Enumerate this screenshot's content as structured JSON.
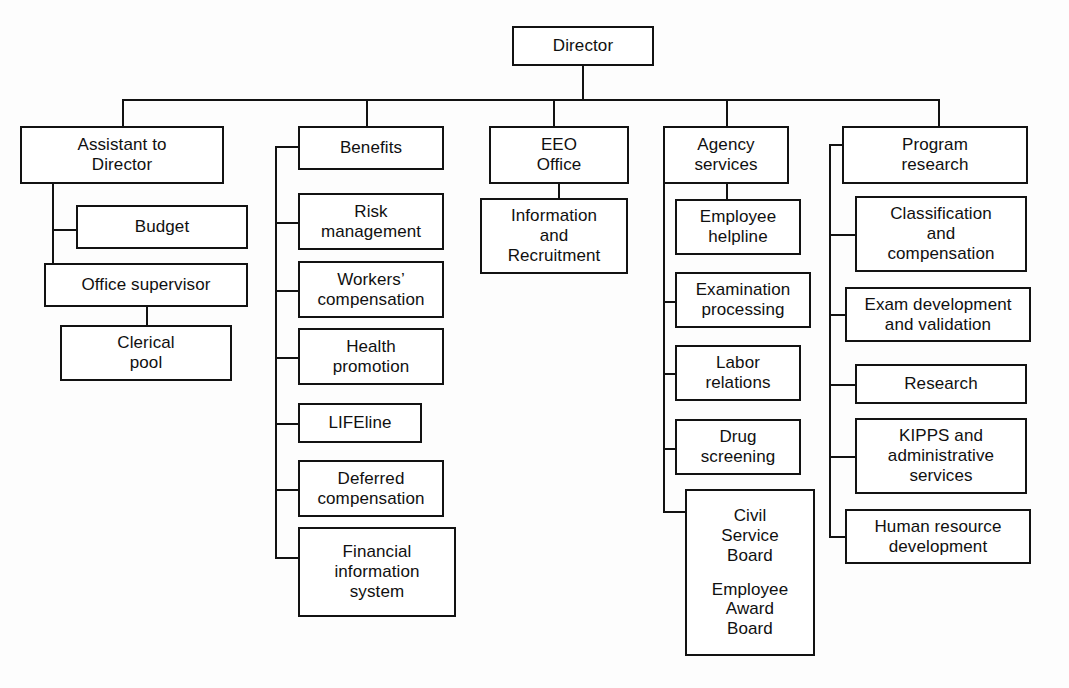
{
  "chart": {
    "type": "org-chart",
    "background_color": "#fdfdfd",
    "line_color": "#121212",
    "box_fill": "#ffffff"
  },
  "root": {
    "label": "Director"
  },
  "divisions": [
    {
      "id": "assistant-to-director",
      "header": "Assistant to\nDirector",
      "header_lines": [
        "Assistant to",
        "Director"
      ],
      "children": [
        {
          "id": "budget",
          "lines": [
            "Budget"
          ]
        },
        {
          "id": "office-supervisor",
          "lines": [
            "Office supervisor"
          ]
        }
      ],
      "grandchildren": [
        {
          "id": "clerical-pool",
          "parent": "office-supervisor",
          "lines": [
            "Clerical",
            "pool"
          ]
        }
      ]
    },
    {
      "id": "benefits",
      "header": "Benefits",
      "header_lines": [
        "Benefits"
      ],
      "children": [
        {
          "id": "risk-management",
          "lines": [
            "Risk",
            "management"
          ]
        },
        {
          "id": "workers-compensation",
          "lines": [
            "Workers’",
            "compensation"
          ]
        },
        {
          "id": "health-promotion",
          "lines": [
            "Health",
            "promotion"
          ]
        },
        {
          "id": "lifeline",
          "lines": [
            "LIFEline"
          ]
        },
        {
          "id": "deferred-compensation",
          "lines": [
            "Deferred",
            "compensation"
          ]
        },
        {
          "id": "financial-information-system",
          "lines": [
            "Financial",
            "information",
            "system"
          ]
        }
      ]
    },
    {
      "id": "eeo-office",
      "header": "EEO\nOffice",
      "header_lines": [
        "EEO",
        "Office"
      ],
      "children": [
        {
          "id": "information-and-recruitment",
          "lines": [
            "Information",
            "and",
            "Recruitment"
          ]
        }
      ]
    },
    {
      "id": "agency-services",
      "header": "Agency\nservices",
      "header_lines": [
        "Agency",
        "services"
      ],
      "children": [
        {
          "id": "employee-helpline",
          "lines": [
            "Employee",
            "helpline"
          ]
        },
        {
          "id": "examination-processing",
          "lines": [
            "Examination",
            "processing"
          ]
        },
        {
          "id": "labor-relations",
          "lines": [
            "Labor",
            "relations"
          ]
        },
        {
          "id": "drug-screening",
          "lines": [
            "Drug",
            "screening"
          ]
        },
        {
          "id": "boards",
          "lines": [
            "Civil",
            "Service",
            "Board",
            "",
            "Employee",
            "Award",
            "Board"
          ]
        }
      ]
    },
    {
      "id": "program-research",
      "header": "Program\nresearch",
      "header_lines": [
        "Program",
        "research"
      ],
      "children": [
        {
          "id": "classification-and-compensation",
          "lines": [
            "Classification",
            "and",
            "compensation"
          ]
        },
        {
          "id": "exam-development-and-validation",
          "lines": [
            "Exam development",
            "and validation"
          ]
        },
        {
          "id": "research",
          "lines": [
            "Research"
          ]
        },
        {
          "id": "kipps-and-administrative-services",
          "lines": [
            "KIPPS and",
            "administrative",
            "services"
          ]
        },
        {
          "id": "human-resource-development",
          "lines": [
            "Human resource",
            "development"
          ]
        }
      ]
    }
  ],
  "labels": {
    "director": "Director",
    "assistant_to_director_l1": "Assistant to",
    "assistant_to_director_l2": "Director",
    "budget": "Budget",
    "office_supervisor": "Office supervisor",
    "clerical_pool_l1": "Clerical",
    "clerical_pool_l2": "pool",
    "benefits": "Benefits",
    "risk_management_l1": "Risk",
    "risk_management_l2": "management",
    "workers_compensation_l1": "Workers’",
    "workers_compensation_l2": "compensation",
    "health_promotion_l1": "Health",
    "health_promotion_l2": "promotion",
    "lifeline": "LIFEline",
    "deferred_compensation_l1": "Deferred",
    "deferred_compensation_l2": "compensation",
    "financial_information_system_l1": "Financial",
    "financial_information_system_l2": "information",
    "financial_information_system_l3": "system",
    "eeo_office_l1": "EEO",
    "eeo_office_l2": "Office",
    "information_and_recruitment_l1": "Information",
    "information_and_recruitment_l2": "and",
    "information_and_recruitment_l3": "Recruitment",
    "agency_services_l1": "Agency",
    "agency_services_l2": "services",
    "employee_helpline_l1": "Employee",
    "employee_helpline_l2": "helpline",
    "examination_processing_l1": "Examination",
    "examination_processing_l2": "processing",
    "labor_relations_l1": "Labor",
    "labor_relations_l2": "relations",
    "drug_screening_l1": "Drug",
    "drug_screening_l2": "screening",
    "civil_service_board_l1": "Civil",
    "civil_service_board_l2": "Service",
    "civil_service_board_l3": "Board",
    "employee_award_board_l1": "Employee",
    "employee_award_board_l2": "Award",
    "employee_award_board_l3": "Board",
    "program_research_l1": "Program",
    "program_research_l2": "research",
    "classification_and_compensation_l1": "Classification",
    "classification_and_compensation_l2": "and",
    "classification_and_compensation_l3": "compensation",
    "exam_development_l1": "Exam development",
    "exam_development_l2": "and validation",
    "research": "Research",
    "kipps_l1": "KIPPS and",
    "kipps_l2": "administrative",
    "kipps_l3": "services",
    "human_resource_development_l1": "Human resource",
    "human_resource_development_l2": "development"
  }
}
